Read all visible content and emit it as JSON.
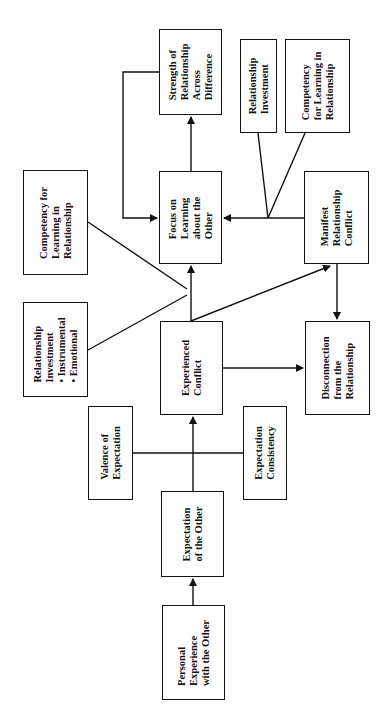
{
  "diagram": {
    "orientation": "rotated-90-ccw",
    "nodes": {
      "personal_experience": {
        "lines": [
          "Personal",
          "Experience",
          "with the Other"
        ]
      },
      "expectation_other": {
        "lines": [
          "Expectation",
          "of the Other"
        ]
      },
      "valence": {
        "lines": [
          "Valence of",
          "Expectation"
        ]
      },
      "consistency": {
        "lines": [
          "Expectation",
          "Consistency"
        ]
      },
      "experienced_conflict": {
        "lines": [
          "Experienced",
          "Conflict"
        ]
      },
      "disconnection": {
        "lines": [
          "Disconnection",
          "from the",
          "Relationship"
        ]
      },
      "manifest_conflict": {
        "lines": [
          "Manifest",
          "Relationship",
          "Conflict"
        ]
      },
      "focus_learning": {
        "lines": [
          "Focus on",
          "Learning",
          "about the",
          "Other"
        ]
      },
      "strength": {
        "lines": [
          "Strength of",
          "Relationship",
          "Across",
          "Difference"
        ]
      },
      "rel_investment_left": {
        "lines": [
          "Relationship",
          "Investment"
        ],
        "bullets": [
          "Instrumental",
          "Emotional"
        ]
      },
      "competency_left": {
        "lines": [
          "Competency for",
          "Learning in",
          "Relationship"
        ]
      },
      "rel_investment_right": {
        "lines": [
          "Relationship",
          "Investment"
        ]
      },
      "competency_right": {
        "lines": [
          "Competency",
          "for Learning in",
          "Relationship"
        ]
      }
    },
    "edges": [
      {
        "from": "Personal Experience with the Other",
        "to": "Expectation of the Other"
      },
      {
        "from": "Expectation of the Other",
        "to": "Experienced Conflict",
        "moderators": [
          "Valence of Expectation",
          "Expectation Consistency"
        ]
      },
      {
        "from": "Experienced Conflict",
        "to": "Focus on Learning about the Other",
        "moderators": [
          "Relationship Investment (Instrumental, Emotional)",
          "Competency for Learning in Relationship"
        ]
      },
      {
        "from": "Experienced Conflict",
        "to": "Manifest Relationship Conflict"
      },
      {
        "from": "Experienced Conflict",
        "to": "Disconnection from the Relationship"
      },
      {
        "from": "Manifest Relationship Conflict",
        "to": "Disconnection from the Relationship"
      },
      {
        "from": "Manifest Relationship Conflict",
        "to": "Focus on Learning about the Other",
        "moderators": [
          "Relationship Investment",
          "Competency for Learning in Relationship"
        ]
      },
      {
        "from": "Focus on Learning about the Other",
        "to": "Strength of Relationship Across Difference"
      },
      {
        "from": "Strength of Relationship Across Difference",
        "to": "Focus on Learning about the Other"
      }
    ]
  }
}
